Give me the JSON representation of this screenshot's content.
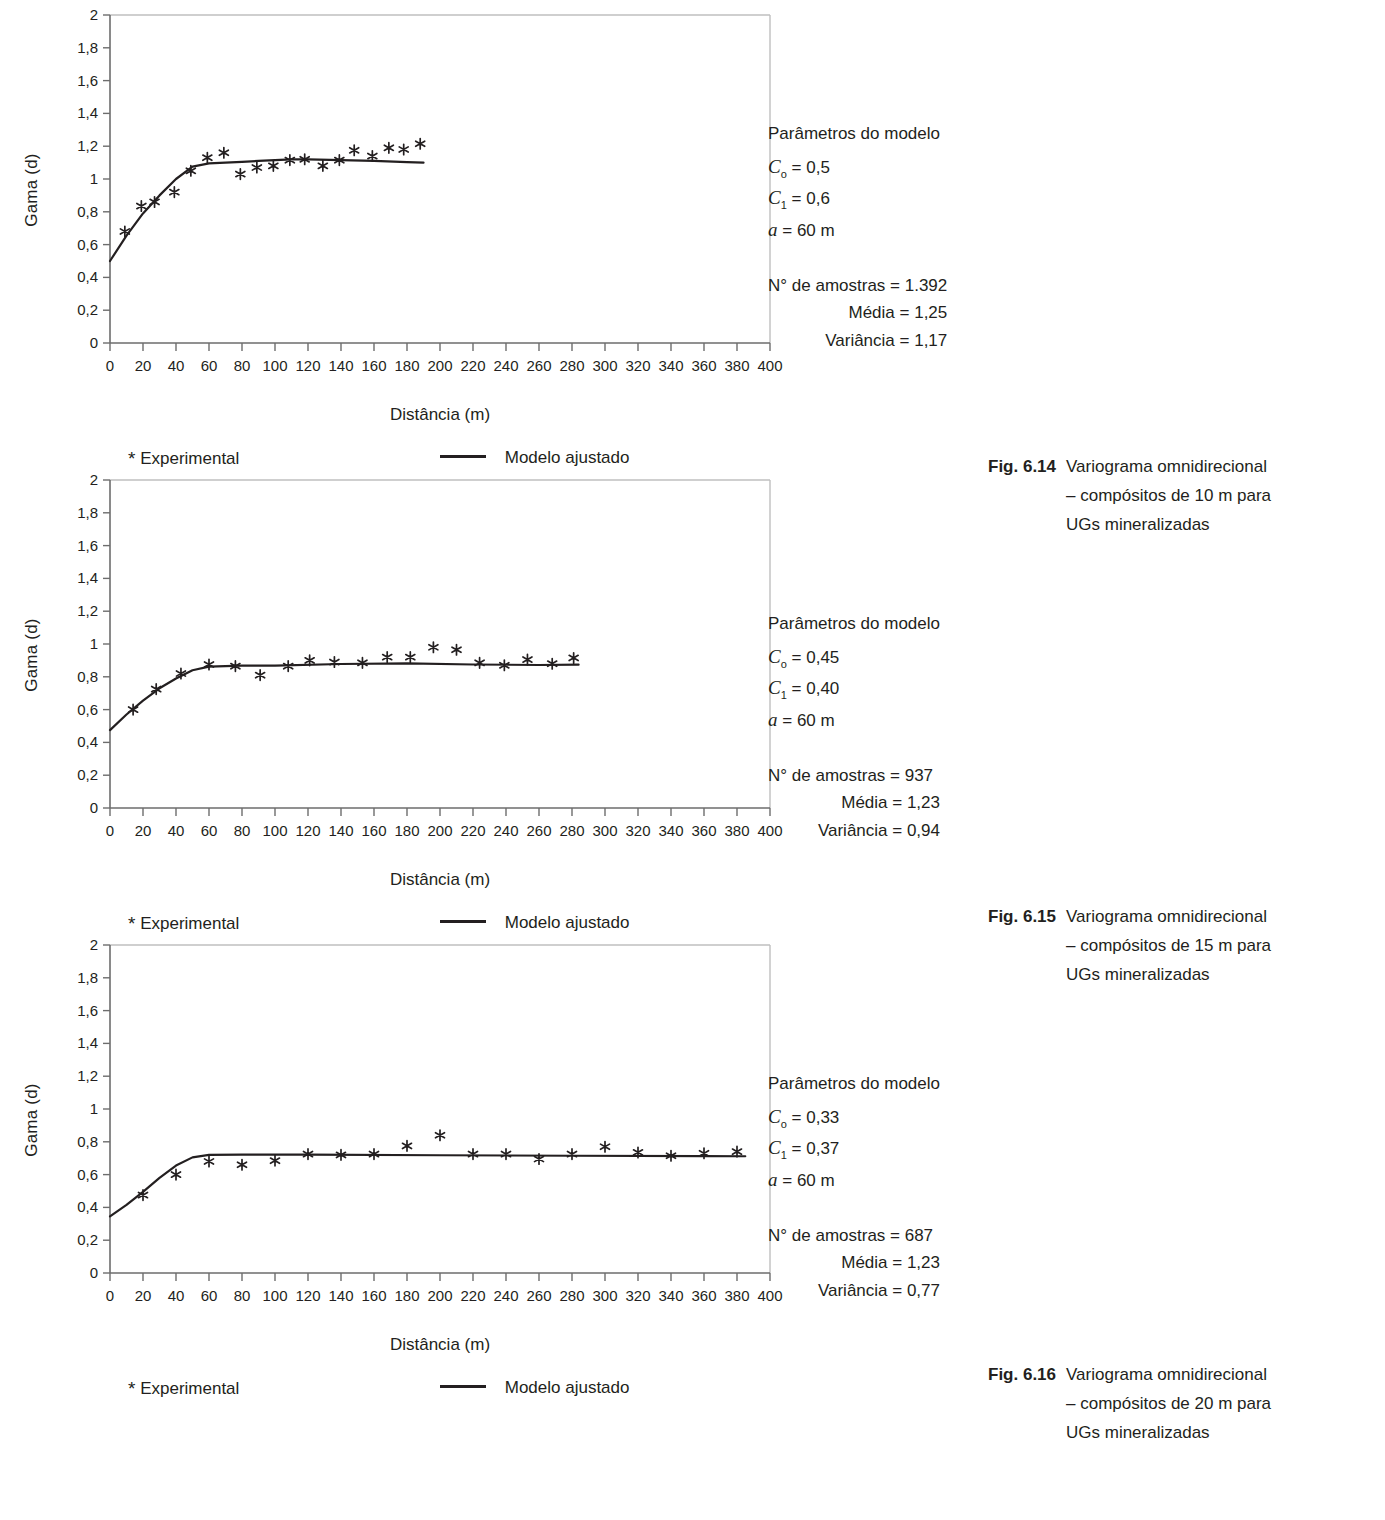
{
  "page": {
    "background": "#ffffff",
    "ink": "#231f20"
  },
  "axis": {
    "ylabel": "Gama (d)",
    "xlabel": "Distância (m)",
    "y_ticks": [
      "0",
      "0,2",
      "0,4",
      "0,6",
      "0,8",
      "1",
      "1,2",
      "1,4",
      "1,6",
      "1,8",
      "2"
    ],
    "x_ticks": [
      "0",
      "20",
      "40",
      "60",
      "80",
      "100",
      "120",
      "140",
      "160",
      "180",
      "200",
      "220",
      "240",
      "260",
      "280",
      "300",
      "320",
      "340",
      "360",
      "380",
      "400"
    ]
  },
  "legend": {
    "experimental_mark": "*",
    "experimental_label": "Experimental",
    "model_label": "Modelo ajustado"
  },
  "figures": [
    {
      "id": "fig-6-14",
      "params": {
        "title": "Parâmetros do modelo",
        "c0_symbol": "C",
        "c0_sub": "o",
        "c0_value": "= 0,5",
        "c1_symbol": "C",
        "c1_sub": "1",
        "c1_value": "= 0,6",
        "a_symbol": "a",
        "a_value": "= 60 m",
        "samples": "N° de amostras = 1.392",
        "mean": "Média = 1,25",
        "variance": "Variância = 1,17"
      },
      "caption": {
        "number": "Fig. 6.14",
        "line1": "Variograma omnidirecional",
        "line2": "– compósitos de 10 m para",
        "line3": "UGs mineralizadas"
      }
    },
    {
      "id": "fig-6-15",
      "params": {
        "title": "Parâmetros do modelo",
        "c0_symbol": "C",
        "c0_sub": "o",
        "c0_value": "= 0,45",
        "c1_symbol": "C",
        "c1_sub": "1",
        "c1_value": "= 0,40",
        "a_symbol": "a",
        "a_value": "= 60 m",
        "samples": "N° de amostras = 937",
        "mean": "Média = 1,23",
        "variance": "Variância = 0,94"
      },
      "caption": {
        "number": "Fig. 6.15",
        "line1": "Variograma omnidirecional",
        "line2": "– compósitos de 15 m para",
        "line3": "UGs mineralizadas"
      }
    },
    {
      "id": "fig-6-16",
      "params": {
        "title": "Parâmetros do modelo",
        "c0_symbol": "C",
        "c0_sub": "o",
        "c0_value": "= 0,33",
        "c1_symbol": "C",
        "c1_sub": "1",
        "c1_value": "= 0,37",
        "a_symbol": "a",
        "a_value": "= 60 m",
        "samples": "N° de amostras = 687",
        "mean": "Média = 1,23",
        "variance": "Variância = 0,77"
      },
      "caption": {
        "number": "Fig. 6.16",
        "line1": "Variograma omnidirecional",
        "line2": "– compósitos de 20 m para",
        "line3": "UGs mineralizadas"
      }
    }
  ],
  "chart_data": [
    {
      "type": "scatter",
      "title": "Fig. 6.14 Variograma omnidirecional – compósitos de 10 m para UGs mineralizadas",
      "xlabel": "Distância (m)",
      "ylabel": "Gama (d)",
      "xlim": [
        0,
        400
      ],
      "ylim": [
        0,
        2
      ],
      "grid": false,
      "legend_position": "below",
      "series": [
        {
          "name": "Experimental",
          "marker": "*",
          "x": [
            9,
            19,
            27,
            39,
            49,
            59,
            69,
            79,
            89,
            99,
            109,
            118,
            129,
            139,
            148,
            159,
            169,
            178,
            188
          ],
          "y": [
            0.68,
            0.835,
            0.86,
            0.92,
            1.05,
            1.13,
            1.16,
            1.03,
            1.07,
            1.08,
            1.115,
            1.12,
            1.08,
            1.115,
            1.175,
            1.14,
            1.19,
            1.18,
            1.215
          ]
        },
        {
          "name": "Modelo ajustado",
          "marker": "line",
          "x": [
            0,
            10,
            20,
            30,
            40,
            50,
            60,
            70,
            80,
            90,
            100,
            110,
            120,
            140,
            160,
            180,
            190
          ],
          "y": [
            0.5,
            0.655,
            0.79,
            0.9,
            1.0,
            1.075,
            1.095,
            1.1,
            1.105,
            1.11,
            1.115,
            1.12,
            1.12,
            1.115,
            1.11,
            1.103,
            1.1
          ]
        }
      ],
      "model_parameters": {
        "C0": 0.5,
        "C1": 0.6,
        "a": 60,
        "n_samples": 1392,
        "mean": 1.25,
        "variance": 1.17
      }
    },
    {
      "type": "scatter",
      "title": "Fig. 6.15 Variograma omnidirecional – compósitos de 15 m para UGs mineralizadas",
      "xlabel": "Distância (m)",
      "ylabel": "Gama (d)",
      "xlim": [
        0,
        400
      ],
      "ylim": [
        0,
        2
      ],
      "grid": false,
      "legend_position": "below",
      "series": [
        {
          "name": "Experimental",
          "marker": "*",
          "x": [
            14,
            28,
            43,
            60,
            76,
            91,
            108,
            121,
            136,
            153,
            168,
            182,
            196,
            210,
            224,
            239,
            253,
            268,
            281
          ],
          "y": [
            0.6,
            0.725,
            0.82,
            0.875,
            0.865,
            0.81,
            0.865,
            0.9,
            0.89,
            0.885,
            0.92,
            0.92,
            0.98,
            0.965,
            0.885,
            0.87,
            0.905,
            0.88,
            0.915
          ]
        },
        {
          "name": "Modelo ajustado",
          "marker": "line",
          "x": [
            0,
            10,
            20,
            30,
            40,
            50,
            60,
            80,
            100,
            140,
            180,
            220,
            260,
            284
          ],
          "y": [
            0.475,
            0.57,
            0.655,
            0.73,
            0.79,
            0.84,
            0.862,
            0.868,
            0.868,
            0.878,
            0.882,
            0.875,
            0.872,
            0.874
          ]
        }
      ],
      "model_parameters": {
        "C0": 0.45,
        "C1": 0.4,
        "a": 60,
        "n_samples": 937,
        "mean": 1.23,
        "variance": 0.94
      }
    },
    {
      "type": "scatter",
      "title": "Fig. 6.16 Variograma omnidirecional – compósitos de 20 m para UGs mineralizadas",
      "xlabel": "Distância (m)",
      "ylabel": "Gama (d)",
      "xlim": [
        0,
        400
      ],
      "ylim": [
        0,
        2
      ],
      "grid": false,
      "legend_position": "below",
      "series": [
        {
          "name": "Experimental",
          "marker": "*",
          "x": [
            20,
            40,
            60,
            80,
            100,
            120,
            140,
            160,
            180,
            200,
            220,
            240,
            260,
            280,
            300,
            320,
            340,
            360,
            380
          ],
          "y": [
            0.475,
            0.6,
            0.68,
            0.66,
            0.685,
            0.725,
            0.72,
            0.725,
            0.775,
            0.84,
            0.725,
            0.725,
            0.695,
            0.725,
            0.77,
            0.735,
            0.715,
            0.73,
            0.74
          ]
        },
        {
          "name": "Modelo ajustado",
          "marker": "line",
          "x": [
            0,
            10,
            20,
            30,
            40,
            50,
            60,
            80,
            120,
            200,
            280,
            360,
            385
          ],
          "y": [
            0.345,
            0.415,
            0.495,
            0.58,
            0.655,
            0.705,
            0.72,
            0.722,
            0.722,
            0.718,
            0.715,
            0.713,
            0.712
          ]
        }
      ],
      "model_parameters": {
        "C0": 0.33,
        "C1": 0.37,
        "a": 60,
        "n_samples": 687,
        "mean": 1.23,
        "variance": 0.77
      }
    }
  ]
}
